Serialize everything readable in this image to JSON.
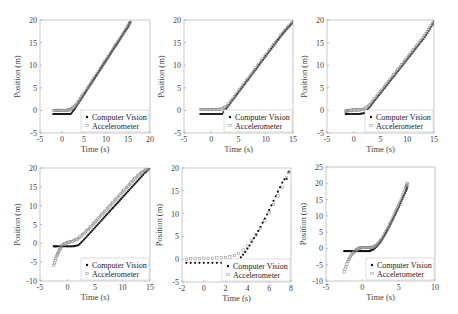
{
  "figure": {
    "layout": "2x3 grid",
    "legend_labels": [
      "Computer Vision",
      "Accelerometer"
    ]
  },
  "chart_data": [
    {
      "type": "scatter",
      "panel": "top-left",
      "xlabel": "Time (s)",
      "ylabel": "Position (m)",
      "xlim": [
        -5,
        20
      ],
      "ylim": [
        -5,
        20
      ],
      "xticks": [
        -5,
        0,
        5,
        10,
        15,
        20
      ],
      "yticks": [
        -5,
        0,
        5,
        10,
        15,
        20
      ],
      "legend": [
        "Computer Vision",
        "Accelerometer"
      ],
      "legend_position": "lower right",
      "series": [
        {
          "name": "Computer Vision",
          "marker": "filled-dot",
          "x": [
            -2,
            -1,
            0,
            1,
            2,
            3,
            4,
            5,
            6,
            7,
            8,
            9,
            10,
            11,
            12,
            13,
            14,
            15,
            15.5
          ],
          "y": [
            -0.8,
            -0.8,
            -0.8,
            -0.8,
            -0.8,
            0.5,
            2,
            3.5,
            5,
            6.5,
            8,
            9.5,
            11,
            12.5,
            14,
            15.5,
            17,
            18.5,
            19.5
          ]
        },
        {
          "name": "Accelerometer",
          "marker": "open-square",
          "x": [
            -2,
            -1,
            0,
            1,
            2,
            3,
            4,
            5,
            6,
            7,
            8,
            9,
            10,
            11,
            12,
            13,
            14,
            15,
            15.5
          ],
          "y": [
            0,
            0,
            0,
            0,
            0.2,
            1,
            2.3,
            3.7,
            5.2,
            6.6,
            8.1,
            9.6,
            11.1,
            12.6,
            14.1,
            15.6,
            17.1,
            18.6,
            19.5
          ]
        }
      ]
    },
    {
      "type": "scatter",
      "panel": "top-middle",
      "xlabel": "Time (s)",
      "ylabel": "Position (m)",
      "xlim": [
        -5,
        15
      ],
      "ylim": [
        -5,
        20
      ],
      "xticks": [
        -5,
        0,
        5,
        10,
        15
      ],
      "yticks": [
        -5,
        0,
        5,
        10,
        15,
        20
      ],
      "legend": [
        "Computer Vision",
        "Accelerometer"
      ],
      "legend_position": "lower right",
      "series": [
        {
          "name": "Computer Vision",
          "marker": "filled-dot",
          "x": [
            -2,
            -1,
            0,
            1,
            2,
            3,
            4,
            5,
            6,
            7,
            8,
            9,
            10,
            11,
            12,
            13,
            14,
            15
          ],
          "y": [
            -0.8,
            -0.8,
            -0.8,
            -0.8,
            -0.8,
            0.8,
            2.4,
            4,
            5.6,
            7.2,
            8.8,
            10.4,
            12,
            13.6,
            15.2,
            16.8,
            18.2,
            19.5
          ]
        },
        {
          "name": "Accelerometer",
          "marker": "open-square",
          "x": [
            -2,
            -1,
            0,
            1,
            2,
            3,
            4,
            5,
            6,
            7,
            8,
            9,
            10,
            11,
            12,
            13,
            14,
            15
          ],
          "y": [
            0.2,
            0.2,
            0.2,
            0.2,
            0.3,
            1.1,
            2.6,
            4.2,
            5.8,
            7.4,
            9,
            10.6,
            12.2,
            13.8,
            15.3,
            16.9,
            18.3,
            19.6
          ]
        }
      ]
    },
    {
      "type": "scatter",
      "panel": "top-right",
      "xlabel": "Time (s)",
      "ylabel": "Position (m)",
      "xlim": [
        -5,
        15
      ],
      "ylim": [
        -5,
        20
      ],
      "xticks": [
        -5,
        0,
        5,
        10,
        15
      ],
      "yticks": [
        -5,
        0,
        5,
        10,
        15,
        20
      ],
      "legend": [
        "Computer Vision",
        "Accelerometer"
      ],
      "legend_position": "lower right",
      "series": [
        {
          "name": "Computer Vision",
          "marker": "filled-dot",
          "x": [
            -1.5,
            -1,
            0,
            1,
            2,
            3,
            4,
            5,
            6,
            7,
            8,
            9,
            10,
            11,
            12,
            13,
            14,
            15
          ],
          "y": [
            -0.8,
            -0.8,
            -0.8,
            -0.8,
            -0.6,
            0.8,
            2.3,
            3.8,
            5.3,
            6.8,
            8.3,
            9.8,
            11.3,
            12.8,
            14.3,
            15.8,
            17.6,
            19.5
          ]
        },
        {
          "name": "Accelerometer",
          "marker": "open-square",
          "x": [
            -1.5,
            -1,
            0,
            1,
            2,
            3,
            4,
            5,
            6,
            7,
            8,
            9,
            10,
            11,
            12,
            13,
            14,
            15
          ],
          "y": [
            -0.2,
            0,
            0.1,
            0.1,
            0.3,
            1.2,
            2.6,
            4.1,
            5.6,
            7.1,
            8.6,
            10.1,
            11.6,
            13.1,
            14.6,
            16.1,
            17.9,
            19.7
          ]
        }
      ]
    },
    {
      "type": "scatter",
      "panel": "bottom-left",
      "xlabel": "Time (s)",
      "ylabel": "Position (m)",
      "xlim": [
        -5,
        15
      ],
      "ylim": [
        -10,
        20
      ],
      "xticks": [
        -5,
        0,
        5,
        10,
        15
      ],
      "yticks": [
        -10,
        -5,
        0,
        5,
        10,
        15,
        20
      ],
      "legend": [
        "Computer Vision",
        "Accelerometer"
      ],
      "legend_position": "lower right",
      "series": [
        {
          "name": "Computer Vision",
          "marker": "filled-dot",
          "x": [
            -2.5,
            -2,
            -1,
            0,
            1,
            2,
            3,
            4,
            5,
            6,
            7,
            8,
            9,
            10,
            11,
            12,
            13,
            14,
            15
          ],
          "y": [
            -0.8,
            -0.8,
            -0.8,
            -0.8,
            -0.8,
            -0.5,
            1,
            2.6,
            4.2,
            5.8,
            7.4,
            9,
            10.6,
            12.2,
            13.8,
            15.4,
            17,
            18.6,
            20
          ]
        },
        {
          "name": "Accelerometer",
          "marker": "open-square",
          "x": [
            -2.5,
            -2,
            -1.5,
            -1,
            0,
            1,
            2,
            3,
            4,
            5,
            6,
            7,
            8,
            9,
            10,
            11,
            12,
            13,
            14,
            15
          ],
          "y": [
            -5.8,
            -3.5,
            -2,
            -0.5,
            0.2,
            0.6,
            1.3,
            2.6,
            4,
            5.6,
            7.2,
            8.8,
            10.4,
            12,
            13.6,
            15.2,
            16.8,
            18.2,
            19.3,
            20
          ]
        }
      ]
    },
    {
      "type": "scatter",
      "panel": "bottom-middle",
      "xlabel": "Time (s)",
      "ylabel": "Position (m)",
      "xlim": [
        -2,
        8
      ],
      "ylim": [
        -5,
        20
      ],
      "xticks": [
        -2,
        0,
        2,
        4,
        6,
        8
      ],
      "yticks": [
        -5,
        0,
        5,
        10,
        15,
        20
      ],
      "legend": [
        "Computer Vision",
        "Accelerometer"
      ],
      "legend_position": "lower right",
      "series": [
        {
          "name": "Computer Vision",
          "marker": "filled-dot",
          "x": [
            -1.6,
            -1.2,
            -0.8,
            -0.4,
            0,
            0.4,
            0.8,
            1.2,
            1.6,
            2,
            2.4,
            2.8,
            3.0,
            3.2,
            3.4,
            3.6,
            3.8,
            4.0,
            4.2,
            4.4,
            4.6,
            4.8,
            5.0,
            5.2,
            5.4,
            5.6,
            5.8,
            6.0,
            6.2,
            6.4,
            6.6,
            6.8,
            7.0,
            7.2,
            7.4,
            7.6,
            7.8
          ],
          "y": [
            -0.8,
            -0.8,
            -0.8,
            -0.8,
            -0.8,
            -0.8,
            -0.8,
            -0.8,
            -0.8,
            -0.8,
            -0.8,
            -0.6,
            -2,
            -0.2,
            0.4,
            1,
            1.6,
            2.3,
            3,
            3.8,
            4.6,
            5.4,
            6.2,
            7.1,
            8,
            8.9,
            9.8,
            10.8,
            11.8,
            12.8,
            13.8,
            14.8,
            15.8,
            16.8,
            17.5,
            17.6,
            19.2
          ]
        },
        {
          "name": "Accelerometer",
          "marker": "open-square",
          "x": [
            -1.6,
            -1.2,
            -0.8,
            -0.4,
            0,
            0.4,
            0.8,
            1.2,
            1.6,
            2,
            2.4,
            2.8,
            3.2,
            3.6,
            4.0,
            4.4,
            4.8,
            5.2,
            5.6,
            6.0,
            6.4,
            6.8,
            7.2,
            7.6,
            7.8
          ],
          "y": [
            0.0,
            0.1,
            0.1,
            0.1,
            0.2,
            0.2,
            0.2,
            0.3,
            0.3,
            0.4,
            0.5,
            0.8,
            1.3,
            2,
            2.9,
            4,
            5.3,
            6.8,
            8.4,
            10.2,
            12,
            13.9,
            15.8,
            17.8,
            19
          ]
        }
      ]
    },
    {
      "type": "scatter",
      "panel": "bottom-right",
      "xlabel": "Time (s)",
      "ylabel": "Position (m)",
      "xlim": [
        -5,
        10
      ],
      "ylim": [
        -10,
        25
      ],
      "xticks": [
        -5,
        0,
        5,
        10
      ],
      "yticks": [
        -10,
        -5,
        0,
        5,
        10,
        15,
        20,
        25
      ],
      "legend": [
        "Computer Vision",
        "Accelerometer"
      ],
      "legend_position": "lower right",
      "series": [
        {
          "name": "Computer Vision",
          "marker": "filled-dot",
          "x": [
            -2.5,
            -2,
            -1.5,
            -1,
            -0.5,
            0,
            0.5,
            1,
            1.5,
            2,
            2.5,
            3,
            3.5,
            4,
            4.5,
            5,
            5.5,
            6,
            6.2
          ],
          "y": [
            -0.8,
            -0.8,
            -0.8,
            -0.8,
            -0.8,
            -0.8,
            -0.8,
            -0.8,
            -0.3,
            0.6,
            2,
            3.8,
            5.8,
            8,
            10.3,
            12.7,
            15.1,
            17.6,
            19
          ]
        },
        {
          "name": "Accelerometer",
          "marker": "open-square",
          "x": [
            -2.5,
            -2,
            -1.5,
            -1,
            -0.5,
            0,
            0.5,
            1,
            1.5,
            2,
            2.5,
            3,
            3.5,
            4,
            4.5,
            5,
            5.5,
            6,
            6.2
          ],
          "y": [
            -7.2,
            -4,
            -2,
            -0.8,
            0,
            0.3,
            0.3,
            0.3,
            0.4,
            1,
            2.3,
            4.1,
            6.1,
            8.4,
            10.8,
            13.2,
            15.8,
            18.6,
            20
          ]
        }
      ]
    }
  ]
}
